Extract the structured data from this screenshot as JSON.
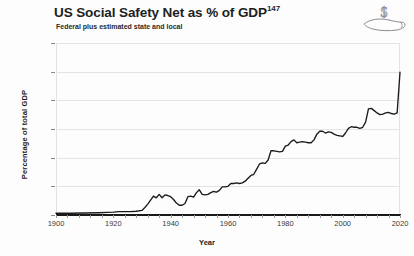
{
  "header": {
    "title": "US Social Safety Net as % of GDP",
    "title_superscript": "147",
    "subtitle": "Federal plus estimated state and local",
    "icon": "hand-holding-dollar-icon",
    "dollar_glyph": "$"
  },
  "chart_data": {
    "type": "line",
    "title": "US Social Safety Net as % of GDP",
    "subtitle": "Federal plus estimated state and local",
    "xlabel": "Year",
    "ylabel": "Percentage of total GDP",
    "xlim": [
      1900,
      2020
    ],
    "ylim": [
      0,
      30
    ],
    "xticks": [
      1900,
      1920,
      1940,
      1960,
      1980,
      2000,
      2020
    ],
    "xtick_labels": [
      "1900",
      "1920",
      "1940",
      "1960",
      "1980",
      "2000",
      "2020"
    ],
    "yticks": [
      0,
      5,
      10,
      15,
      20,
      25,
      30
    ],
    "ytick_labels": [
      "0%",
      "5%",
      "10%",
      "15%",
      "20%",
      "25%",
      "30%"
    ],
    "grid": "horizontal",
    "legend": "none",
    "series_name": "Social safety net spending",
    "line_color": "#1b1b1b",
    "x": [
      1900,
      1905,
      1910,
      1915,
      1918,
      1920,
      1922,
      1924,
      1926,
      1928,
      1930,
      1931,
      1932,
      1933,
      1934,
      1935,
      1936,
      1937,
      1938,
      1939,
      1940,
      1941,
      1942,
      1943,
      1944,
      1945,
      1946,
      1947,
      1948,
      1949,
      1950,
      1951,
      1952,
      1953,
      1954,
      1955,
      1956,
      1957,
      1958,
      1959,
      1960,
      1961,
      1962,
      1963,
      1964,
      1965,
      1966,
      1967,
      1968,
      1969,
      1970,
      1971,
      1972,
      1973,
      1974,
      1975,
      1976,
      1977,
      1978,
      1979,
      1980,
      1981,
      1982,
      1983,
      1984,
      1985,
      1986,
      1987,
      1988,
      1989,
      1990,
      1991,
      1992,
      1993,
      1994,
      1995,
      1996,
      1997,
      1998,
      1999,
      2000,
      2001,
      2002,
      2003,
      2004,
      2005,
      2006,
      2007,
      2008,
      2009,
      2010,
      2011,
      2012,
      2013,
      2014,
      2015,
      2016,
      2017,
      2018,
      2019,
      2020
    ],
    "y": [
      0.3,
      0.3,
      0.35,
      0.4,
      0.45,
      0.5,
      0.6,
      0.6,
      0.6,
      0.65,
      0.8,
      1.3,
      1.9,
      2.6,
      3.3,
      3.0,
      3.6,
      3.0,
      3.5,
      3.4,
      3.2,
      2.7,
      2.1,
      1.7,
      1.7,
      2.0,
      3.2,
      3.3,
      3.1,
      3.9,
      4.4,
      3.6,
      3.5,
      3.6,
      3.9,
      4.1,
      4.0,
      4.3,
      4.9,
      4.9,
      5.0,
      5.5,
      5.5,
      5.6,
      5.5,
      5.6,
      5.9,
      6.4,
      6.9,
      7.1,
      8.0,
      8.9,
      9.1,
      9.0,
      9.6,
      11.2,
      11.2,
      11.1,
      11.0,
      11.1,
      12.0,
      12.2,
      12.8,
      13.1,
      12.6,
      12.7,
      12.8,
      12.7,
      12.6,
      12.6,
      13.1,
      14.1,
      14.6,
      14.6,
      14.3,
      14.5,
      14.4,
      14.1,
      13.9,
      13.8,
      13.7,
      14.3,
      15.1,
      15.4,
      15.3,
      15.3,
      15.1,
      15.3,
      16.2,
      18.5,
      18.6,
      18.2,
      17.8,
      17.5,
      17.6,
      17.8,
      17.9,
      17.7,
      17.6,
      17.8,
      24.9
    ]
  },
  "footer": {
    "ghost_text": ""
  }
}
